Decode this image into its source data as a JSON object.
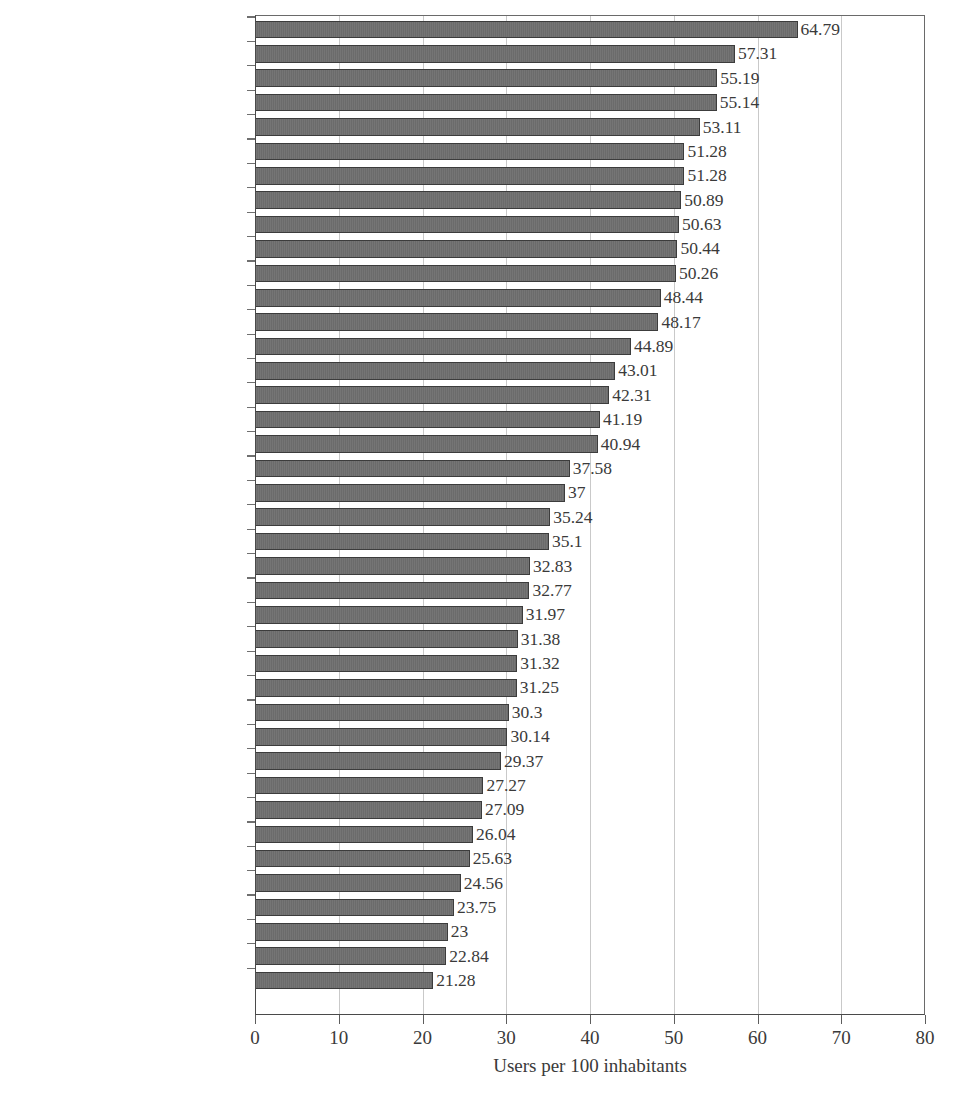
{
  "chart_data": {
    "type": "bar",
    "orientation": "horizontal",
    "title": "",
    "xlabel": "Users per 100 inhabitants",
    "ylabel": "",
    "xlim": [
      0,
      80
    ],
    "xticks": [
      0,
      10,
      20,
      30,
      40,
      50,
      60,
      70,
      80
    ],
    "grid": "vertical",
    "legend": "none",
    "bar_color": "#6e6e6e",
    "bar_edge_color": "#3c3c3c",
    "gridline_color": "#c9c9c9",
    "axis_color": "#4a4a4a",
    "categories": [
      "Iceland",
      "Sweden",
      "Korea",
      "United States",
      "San Marino",
      "Denmark",
      "Canada",
      "Finland",
      "Netherlands",
      "Singapore",
      "Norway",
      "New Zealand",
      "Australia",
      "Japan",
      "Hong Kong",
      "United Kingdom",
      "Germany",
      "Austria",
      "Slovenia",
      "Luxembourg",
      "Italy",
      "Switzerland",
      "Belgium",
      "Estonia",
      "Malaysia",
      "France",
      "United Arab Emirates",
      "Guam",
      "Malta",
      "Israel",
      "Cyprus",
      "United States Virgin Islands",
      "Ireland",
      "Macao",
      "Czech Republic",
      "Bahrain",
      "Chile",
      "Poland",
      "Jamaica",
      "Saint Kitts and Nevis"
    ],
    "values": [
      64.79,
      57.31,
      55.19,
      55.14,
      53.11,
      51.28,
      51.28,
      50.89,
      50.63,
      50.44,
      50.26,
      48.44,
      48.17,
      44.89,
      43.01,
      42.31,
      41.19,
      40.94,
      37.58,
      37,
      35.24,
      35.1,
      32.83,
      32.77,
      31.97,
      31.38,
      31.32,
      31.25,
      30.3,
      30.14,
      29.37,
      27.27,
      27.09,
      26.04,
      25.63,
      24.56,
      23.75,
      23,
      22.84,
      21.28
    ],
    "value_labels": [
      "64.79",
      "57.31",
      "55.19",
      "55.14",
      "53.11",
      "51.28",
      "51.28",
      "50.89",
      "50.63",
      "50.44",
      "50.26",
      "48.44",
      "48.17",
      "44.89",
      "43.01",
      "42.31",
      "41.19",
      "40.94",
      "37.58",
      "37",
      "35.24",
      "35.1",
      "32.83",
      "32.77",
      "31.97",
      "31.38",
      "31.32",
      "31.25",
      "30.3",
      "30.14",
      "29.37",
      "27.27",
      "27.09",
      "26.04",
      "25.63",
      "24.56",
      "23.75",
      "23",
      "22.84",
      "21.28"
    ]
  }
}
